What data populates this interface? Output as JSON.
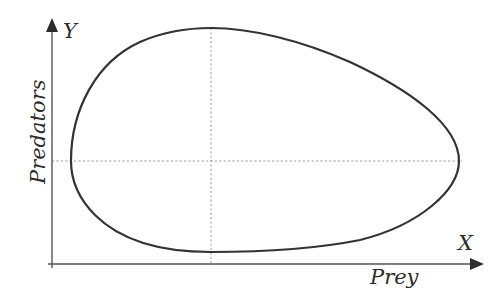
{
  "diagram": {
    "type": "phase-portrait",
    "x_axis": {
      "letter": "X",
      "title": "Prey"
    },
    "y_axis": {
      "letter": "Y",
      "title": "Predators"
    },
    "equilibrium_guides": {
      "vertical_at_x": 211,
      "horizontal_at_y": 161
    },
    "cycle_extremes": {
      "top": [
        211,
        28
      ],
      "bottom": [
        211,
        252
      ],
      "left": [
        71,
        161
      ],
      "right": [
        459,
        161
      ]
    },
    "colors": {
      "curve": "#333333",
      "axes": "#555555",
      "guides": "#9a9a9a",
      "background": "#ffffff"
    }
  }
}
